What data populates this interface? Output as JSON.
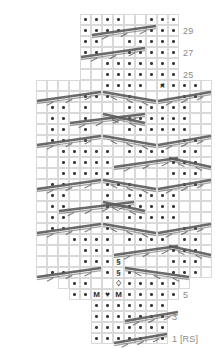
{
  "chart": {
    "cell_size": 11,
    "origin_x": 36,
    "origin_y": 14,
    "total_rows": 30,
    "total_cols": 16,
    "grid_color": "#d9d9d9",
    "dot_color": "#3a3a3a",
    "cable_color": "#5a5a5a",
    "label_color": "#8a8a8a",
    "row_labels": [
      {
        "text": "29",
        "row": 1
      },
      {
        "text": "27",
        "row": 3
      },
      {
        "text": "25",
        "row": 5
      },
      {
        "text": "23",
        "row": 7
      },
      {
        "text": "21",
        "row": 9
      },
      {
        "text": "19",
        "row": 11
      },
      {
        "text": "17",
        "row": 13
      },
      {
        "text": "15",
        "row": 15
      },
      {
        "text": "13",
        "row": 17
      },
      {
        "text": "11",
        "row": 19
      },
      {
        "text": "9",
        "row": 21
      },
      {
        "text": "7",
        "row": 23
      },
      {
        "text": "5",
        "row": 25
      },
      {
        "text": "3",
        "row": 27
      },
      {
        "text": "1 [RS]",
        "row": 29
      }
    ],
    "row_extents": [
      {
        "row": 0,
        "start": 4,
        "end": 13
      },
      {
        "row": 1,
        "start": 4,
        "end": 13
      },
      {
        "row": 2,
        "start": 4,
        "end": 13
      },
      {
        "row": 3,
        "start": 4,
        "end": 13
      },
      {
        "row": 4,
        "start": 4,
        "end": 13
      },
      {
        "row": 5,
        "start": 4,
        "end": 13
      },
      {
        "row": 6,
        "start": 0,
        "end": 16
      },
      {
        "row": 7,
        "start": 0,
        "end": 16
      },
      {
        "row": 8,
        "start": 0,
        "end": 16
      },
      {
        "row": 9,
        "start": 0,
        "end": 16
      },
      {
        "row": 10,
        "start": 0,
        "end": 16
      },
      {
        "row": 11,
        "start": 0,
        "end": 16
      },
      {
        "row": 12,
        "start": 0,
        "end": 16
      },
      {
        "row": 13,
        "start": 0,
        "end": 16
      },
      {
        "row": 14,
        "start": 0,
        "end": 16
      },
      {
        "row": 15,
        "start": 0,
        "end": 16
      },
      {
        "row": 16,
        "start": 0,
        "end": 16
      },
      {
        "row": 17,
        "start": 0,
        "end": 16
      },
      {
        "row": 18,
        "start": 0,
        "end": 16
      },
      {
        "row": 19,
        "start": 0,
        "end": 16
      },
      {
        "row": 20,
        "start": 0,
        "end": 16
      },
      {
        "row": 21,
        "start": 0,
        "end": 16
      },
      {
        "row": 22,
        "start": 0,
        "end": 16
      },
      {
        "row": 23,
        "start": 0,
        "end": 16
      },
      {
        "row": 24,
        "start": 2,
        "end": 14
      },
      {
        "row": 25,
        "start": 3,
        "end": 13
      },
      {
        "row": 26,
        "start": 5,
        "end": 12
      },
      {
        "row": 27,
        "start": 5,
        "end": 12
      },
      {
        "row": 28,
        "start": 5,
        "end": 12
      },
      {
        "row": 29,
        "start": 5,
        "end": 12
      }
    ],
    "purl_dots": [
      {
        "row": 0,
        "cols": [
          4,
          5,
          6,
          7,
          10,
          11,
          12,
          13
        ]
      },
      {
        "row": 1,
        "cols": [
          4,
          5,
          6,
          7,
          10,
          11,
          12,
          13
        ]
      },
      {
        "row": 2,
        "cols": [
          4,
          5,
          8,
          9,
          10,
          11,
          12,
          13
        ]
      },
      {
        "row": 3,
        "cols": [
          4,
          5,
          8,
          9,
          10,
          11,
          12,
          13
        ]
      },
      {
        "row": 4,
        "cols": [
          6,
          7,
          8,
          9,
          10,
          11,
          12,
          13
        ]
      },
      {
        "row": 5,
        "cols": [
          6,
          7,
          8,
          9,
          10,
          11,
          12,
          13
        ]
      },
      {
        "row": 6,
        "cols": [
          6,
          7,
          8,
          9,
          11,
          12,
          13,
          14
        ]
      },
      {
        "row": 7,
        "cols": [
          4,
          5,
          6,
          8,
          13,
          14
        ]
      },
      {
        "row": 8,
        "cols": [
          1,
          2,
          4,
          8,
          9,
          10,
          11,
          12,
          13
        ]
      },
      {
        "row": 9,
        "cols": [
          1,
          2,
          4,
          8,
          9,
          10,
          11,
          12,
          13
        ]
      },
      {
        "row": 10,
        "cols": [
          1,
          2,
          4,
          8,
          9,
          10,
          11,
          12,
          13
        ]
      },
      {
        "row": 11,
        "cols": [
          1,
          2,
          4,
          13,
          14
        ]
      },
      {
        "row": 12,
        "cols": [
          2,
          3,
          4,
          5,
          6,
          8,
          9,
          10,
          11,
          13,
          14
        ]
      },
      {
        "row": 13,
        "cols": [
          2,
          3,
          4,
          5,
          6,
          12,
          13,
          14
        ]
      },
      {
        "row": 14,
        "cols": [
          2,
          3,
          4,
          5,
          6,
          12,
          13,
          14
        ]
      },
      {
        "row": 15,
        "cols": [
          1,
          2,
          6,
          7,
          8,
          13,
          14
        ]
      },
      {
        "row": 16,
        "cols": [
          1,
          2,
          6,
          8,
          9,
          10,
          11,
          12
        ]
      },
      {
        "row": 17,
        "cols": [
          1,
          2,
          6,
          8,
          9,
          10,
          11,
          12
        ]
      },
      {
        "row": 18,
        "cols": [
          1,
          2,
          6,
          8,
          9,
          10,
          11,
          12
        ]
      },
      {
        "row": 19,
        "cols": [
          1,
          2,
          6,
          13,
          14
        ]
      },
      {
        "row": 20,
        "cols": [
          3,
          4,
          5,
          6,
          8,
          9,
          10,
          11,
          13,
          14
        ]
      },
      {
        "row": 21,
        "cols": [
          4,
          5,
          6,
          12,
          13,
          14
        ]
      },
      {
        "row": 22,
        "cols": [
          4,
          5,
          6,
          12,
          13,
          14
        ]
      },
      {
        "row": 23,
        "cols": [
          1,
          2,
          6,
          8,
          12,
          13,
          14
        ]
      },
      {
        "row": 24,
        "cols": [
          3,
          4,
          8,
          9,
          10,
          11,
          12
        ]
      },
      {
        "row": 25,
        "cols": [
          3,
          4,
          8,
          9,
          10,
          11,
          12
        ]
      },
      {
        "row": 26,
        "cols": [
          5,
          6,
          7,
          8,
          9,
          10,
          11
        ]
      },
      {
        "row": 27,
        "cols": [
          5,
          6,
          7,
          8,
          9,
          10,
          11
        ]
      },
      {
        "row": 28,
        "cols": [
          5,
          6,
          7,
          8,
          9,
          10,
          11
        ]
      },
      {
        "row": 29,
        "cols": [
          5,
          6,
          7,
          8,
          9,
          11
        ]
      }
    ],
    "symbols": [
      {
        "row": 6,
        "col": 11,
        "glyph": "⑁",
        "name": "bobble-symbol-a"
      },
      {
        "row": 22,
        "col": 7,
        "glyph": "§",
        "name": "bobble-symbol-chain-1"
      },
      {
        "row": 23,
        "col": 7,
        "glyph": "§",
        "name": "bobble-symbol-chain-2"
      },
      {
        "row": 24,
        "col": 7,
        "glyph": "♢",
        "name": "bobble-symbol-chain-3"
      },
      {
        "row": 25,
        "col": 5,
        "glyph": "M",
        "name": "make-one-left-symbol"
      },
      {
        "row": 25,
        "col": 6,
        "glyph": "♥",
        "name": "center-decrease-symbol"
      },
      {
        "row": 25,
        "col": 7,
        "glyph": "M",
        "name": "make-one-right-symbol"
      }
    ],
    "cables": [
      {
        "row": 1,
        "col": 5,
        "span": 6,
        "dir": "right",
        "name": "cable-cross-r1"
      },
      {
        "row": 3,
        "col": 4,
        "span": 6,
        "dir": "right",
        "name": "cable-cross-r3"
      },
      {
        "row": 7,
        "col": 0,
        "span": 6,
        "dir": "right",
        "name": "cable-cross-r7a"
      },
      {
        "row": 7,
        "col": 6,
        "span": 5,
        "dir": "left",
        "name": "cable-cross-r7b"
      },
      {
        "row": 7,
        "col": 11,
        "span": 5,
        "dir": "right",
        "name": "cable-cross-r7c"
      },
      {
        "row": 9,
        "col": 3,
        "span": 7,
        "dir": "right",
        "name": "cable-cross-r9a"
      },
      {
        "row": 9,
        "col": 6,
        "span": 4,
        "dir": "left",
        "name": "cable-cross-r9b"
      },
      {
        "row": 11,
        "col": 0,
        "span": 6,
        "dir": "right",
        "name": "cable-cross-r11a"
      },
      {
        "row": 11,
        "col": 6,
        "span": 5,
        "dir": "left",
        "name": "cable-cross-r11b"
      },
      {
        "row": 11,
        "col": 11,
        "span": 5,
        "dir": "right",
        "name": "cable-cross-r11c"
      },
      {
        "row": 13,
        "col": 7,
        "span": 6,
        "dir": "right",
        "name": "cable-cross-r13a"
      },
      {
        "row": 13,
        "col": 12,
        "span": 4,
        "dir": "left",
        "name": "cable-cross-r13b"
      },
      {
        "row": 15,
        "col": 0,
        "span": 6,
        "dir": "right",
        "name": "cable-cross-r15a"
      },
      {
        "row": 15,
        "col": 6,
        "span": 5,
        "dir": "left",
        "name": "cable-cross-r15b"
      },
      {
        "row": 15,
        "col": 11,
        "span": 5,
        "dir": "right",
        "name": "cable-cross-r15c"
      },
      {
        "row": 17,
        "col": 2,
        "span": 7,
        "dir": "right",
        "name": "cable-cross-r17a"
      },
      {
        "row": 17,
        "col": 6,
        "span": 4,
        "dir": "left",
        "name": "cable-cross-r17b"
      },
      {
        "row": 19,
        "col": 0,
        "span": 6,
        "dir": "right",
        "name": "cable-cross-r19a"
      },
      {
        "row": 19,
        "col": 6,
        "span": 5,
        "dir": "left",
        "name": "cable-cross-r19b"
      },
      {
        "row": 19,
        "col": 11,
        "span": 5,
        "dir": "right",
        "name": "cable-cross-r19c"
      },
      {
        "row": 21,
        "col": 7,
        "span": 6,
        "dir": "right",
        "name": "cable-cross-r21a"
      },
      {
        "row": 21,
        "col": 12,
        "span": 4,
        "dir": "left",
        "name": "cable-cross-r21b"
      },
      {
        "row": 23,
        "col": 0,
        "span": 6,
        "dir": "right",
        "name": "cable-cross-r23a"
      },
      {
        "row": 23,
        "col": 8,
        "span": 6,
        "dir": "left",
        "name": "cable-cross-r23b"
      },
      {
        "row": 27,
        "col": 8,
        "span": 5,
        "dir": "right",
        "name": "cable-cross-r27"
      },
      {
        "row": 29,
        "col": 7,
        "span": 5,
        "dir": "right",
        "name": "cable-cross-r29"
      }
    ]
  }
}
